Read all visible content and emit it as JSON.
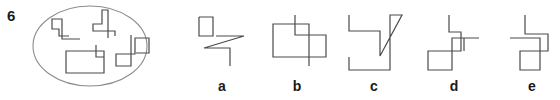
{
  "question": {
    "number": "6",
    "line_color": "#4a4a4a",
    "ellipse_color": "#8c8c8c"
  },
  "ellipse": {
    "cx": 90,
    "cy": 46,
    "rx": 57,
    "ry": 40,
    "figures": [
      {
        "name": "figure-top-left",
        "points": "69,36 59,36 59,29 52,29 52,19 62,19 62,39 66,39 80,39"
      },
      {
        "name": "figure-top-middle",
        "points": "115,36 115,31 93,31 93,24 102,24 102,10 108,10 108,38"
      },
      {
        "name": "figure-bottom-left",
        "points": "96,45 96,57 104,57 104,73 66,73 66,51 104,51 104,62"
      },
      {
        "name": "figure-right",
        "points": "131,35 131,66 116,66 116,54 135,54 135,38 149,38 149,53 136,53"
      }
    ]
  },
  "options": [
    {
      "label": "a",
      "label_x": 222,
      "points": "199,17 199,36 213,36 213,17 199,17 M 216,36 244,36 204,48 230,48 230,66"
    },
    {
      "label": "b",
      "label_x": 297,
      "points": "295,15 295,35 326,35 326,57 273,57 273,24 309,24 309,66"
    },
    {
      "label": "c",
      "label_x": 374,
      "points": "349,15 349,31 380,31 380,56 402,15 390,15 390,70 349,70 349,57"
    },
    {
      "label": "d",
      "label_x": 454,
      "points": "449,15 449,32 461,32 461,51 428,51 428,70 452,70 452,38 479,38 M 464,38 464,51"
    },
    {
      "label": "e",
      "label_x": 532,
      "points": "525,15 525,34 548,34 548,51 520,51 520,70 540,70 540,38 510,38"
    }
  ]
}
